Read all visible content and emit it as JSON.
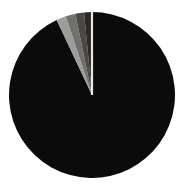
{
  "chart_data": {
    "type": "pie",
    "title": "",
    "subtitle": "",
    "xlabel": "",
    "ylabel": "",
    "grid": false,
    "legend_position": "none",
    "labels_visible": false,
    "start_angle_deg": 0,
    "direction": "clockwise",
    "categories": [
      "Slice 1",
      "Slice 2",
      "Slice 3",
      "Slice 4",
      "Slice 5"
    ],
    "values": [
      93.0,
      1.9,
      1.9,
      1.7,
      1.5
    ],
    "units": "percent",
    "colors": [
      "#0b0a0a",
      "#9a9a98",
      "#6d6d6b",
      "#4a4644",
      "#2b2523"
    ],
    "separator_color": "#e8e8e6",
    "background_color": "#ffffff",
    "slices": [
      {
        "label": "Slice 1",
        "value": 93.0,
        "color": "#0b0a0a",
        "start_angle_deg": 0.0,
        "end_angle_deg": 334.8
      },
      {
        "label": "Slice 2",
        "value": 1.9,
        "color": "#9a9a98",
        "start_angle_deg": 334.8,
        "end_angle_deg": 341.6
      },
      {
        "label": "Slice 3",
        "value": 1.9,
        "color": "#6d6d6b",
        "start_angle_deg": 341.6,
        "end_angle_deg": 348.4
      },
      {
        "label": "Slice 4",
        "value": 1.7,
        "color": "#4a4644",
        "start_angle_deg": 348.4,
        "end_angle_deg": 354.5
      },
      {
        "label": "Slice 5",
        "value": 1.5,
        "color": "#2b2523",
        "start_angle_deg": 354.5,
        "end_angle_deg": 360.0
      }
    ],
    "geometry": {
      "center_x": 92,
      "center_y": 95,
      "radius": 83
    }
  }
}
